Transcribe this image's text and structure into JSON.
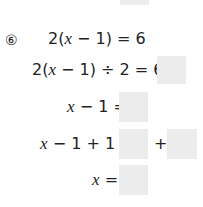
{
  "problem": {
    "number": "⑥",
    "lines": [
      {
        "pre": "2(",
        "var": "x",
        "post": " − 1) = 6"
      },
      {
        "pre": "2(",
        "var": "x",
        "post": " − 1) ÷ 2 = 6 ÷"
      },
      {
        "pre": "",
        "var": "x",
        "post": " − 1 ="
      },
      {
        "pre": "",
        "var": "x",
        "post": " − 1 + 1 ="
      },
      {
        "pre": "",
        "var": "x",
        "post": " ="
      }
    ],
    "plus": "+"
  }
}
